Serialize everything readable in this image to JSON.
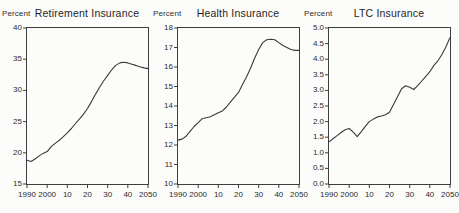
{
  "figure": {
    "background": "#fcfcfa",
    "line_color": "#3a3a3a",
    "axis_color": "#3e3e3e"
  },
  "chart_data": [
    {
      "type": "line",
      "title": "Retirement Insurance",
      "ylabel": "Percent",
      "ylim": [
        15,
        40
      ],
      "xlim": [
        1990,
        2050
      ],
      "grid": false,
      "legend": "none",
      "ytick_labels": [
        "40",
        "35",
        "30",
        "25",
        "20",
        "15"
      ],
      "ytick_values": [
        40,
        35,
        30,
        25,
        20,
        15
      ],
      "xtick_labels": [
        "1990",
        "2000",
        "10",
        "20",
        "30",
        "40",
        "2050"
      ],
      "xtick_values": [
        1990,
        2000,
        2010,
        2020,
        2030,
        2040,
        2050
      ],
      "x": [
        1990,
        1992,
        1994,
        1996,
        1998,
        2000,
        2002,
        2004,
        2006,
        2008,
        2010,
        2012,
        2014,
        2016,
        2018,
        2020,
        2022,
        2024,
        2026,
        2028,
        2030,
        2032,
        2034,
        2036,
        2038,
        2040,
        2042,
        2044,
        2046,
        2048,
        2050
      ],
      "y": [
        18.8,
        18.6,
        19.0,
        19.5,
        19.9,
        20.2,
        21.0,
        21.5,
        22.0,
        22.6,
        23.2,
        23.9,
        24.7,
        25.4,
        26.2,
        27.1,
        28.2,
        29.4,
        30.5,
        31.5,
        32.4,
        33.3,
        34.0,
        34.4,
        34.5,
        34.4,
        34.2,
        34.0,
        33.8,
        33.6,
        33.5
      ]
    },
    {
      "type": "line",
      "title": "Health Insurance",
      "ylabel": "Percent",
      "ylim": [
        10,
        18
      ],
      "xlim": [
        1990,
        2050
      ],
      "grid": false,
      "legend": "none",
      "ytick_labels": [
        "18",
        "17",
        "16",
        "15",
        "14",
        "13",
        "12",
        "11",
        "10"
      ],
      "ytick_values": [
        18,
        17,
        16,
        15,
        14,
        13,
        12,
        11,
        10
      ],
      "xtick_labels": [
        "1990",
        "2000",
        "10",
        "20",
        "30",
        "40",
        "2050"
      ],
      "xtick_values": [
        1990,
        2000,
        2010,
        2020,
        2030,
        2040,
        2050
      ],
      "x": [
        1990,
        1992,
        1994,
        1996,
        1998,
        2000,
        2002,
        2004,
        2006,
        2008,
        2010,
        2012,
        2014,
        2016,
        2018,
        2020,
        2022,
        2024,
        2026,
        2028,
        2030,
        2032,
        2034,
        2036,
        2038,
        2040,
        2042,
        2044,
        2046,
        2048,
        2050
      ],
      "y": [
        12.25,
        12.3,
        12.45,
        12.7,
        12.95,
        13.15,
        13.35,
        13.4,
        13.45,
        13.55,
        13.65,
        13.75,
        13.95,
        14.2,
        14.45,
        14.7,
        15.1,
        15.5,
        15.95,
        16.45,
        16.9,
        17.25,
        17.4,
        17.42,
        17.4,
        17.25,
        17.1,
        17.0,
        16.9,
        16.85,
        16.85
      ]
    },
    {
      "type": "line",
      "title": "LTC Insurance",
      "ylabel": "Percent",
      "ylim": [
        0.0,
        5.0
      ],
      "xlim": [
        1990,
        2050
      ],
      "grid": false,
      "legend": "none",
      "ytick_labels": [
        "5.0",
        "4.5",
        "4.0",
        "3.5",
        "3.0",
        "2.5",
        "2.0",
        "1.5",
        "1.0",
        "0.5",
        "0.0"
      ],
      "ytick_values": [
        5.0,
        4.5,
        4.0,
        3.5,
        3.0,
        2.5,
        2.0,
        1.5,
        1.0,
        0.5,
        0.0
      ],
      "xtick_labels": [
        "1990",
        "2000",
        "10",
        "20",
        "30",
        "40",
        "2050"
      ],
      "xtick_values": [
        1990,
        2000,
        2010,
        2020,
        2030,
        2040,
        2050
      ],
      "x": [
        1990,
        1992,
        1994,
        1996,
        1998,
        2000,
        2002,
        2004,
        2006,
        2008,
        2010,
        2012,
        2014,
        2016,
        2018,
        2020,
        2022,
        2024,
        2026,
        2028,
        2030,
        2032,
        2034,
        2036,
        2038,
        2040,
        2042,
        2044,
        2046,
        2048,
        2050
      ],
      "y": [
        1.35,
        1.45,
        1.55,
        1.65,
        1.74,
        1.78,
        1.66,
        1.52,
        1.68,
        1.85,
        2.0,
        2.08,
        2.15,
        2.18,
        2.22,
        2.3,
        2.55,
        2.8,
        3.05,
        3.15,
        3.1,
        3.03,
        3.15,
        3.3,
        3.45,
        3.6,
        3.8,
        3.95,
        4.15,
        4.4,
        4.7
      ]
    }
  ]
}
